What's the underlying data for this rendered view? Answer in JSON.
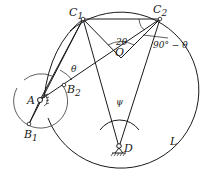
{
  "diagram": {
    "labels": {
      "C1": "C",
      "C1_sub": "1",
      "C2": "C",
      "C2_sub": "2",
      "A": "A",
      "B1": "B",
      "B1_sub": "1",
      "B2": "B",
      "B2_sub": "2",
      "O": "O",
      "D": "D",
      "L": "L",
      "theta": "θ",
      "two_theta": "2θ",
      "psi": "ψ",
      "ninety_minus_theta": "90° − θ"
    },
    "points": {
      "C1": [
        83,
        19
      ],
      "C2": [
        160,
        19
      ],
      "A": [
        40,
        100
      ],
      "B1": [
        29,
        124
      ],
      "B2": [
        64,
        85
      ],
      "O": [
        121,
        58
      ],
      "D": [
        119,
        149
      ]
    },
    "circle_L": {
      "cx": 120,
      "cy": 92,
      "r": 78
    },
    "crank_circle": {
      "cx": 40,
      "cy": 100,
      "r": 27
    }
  }
}
